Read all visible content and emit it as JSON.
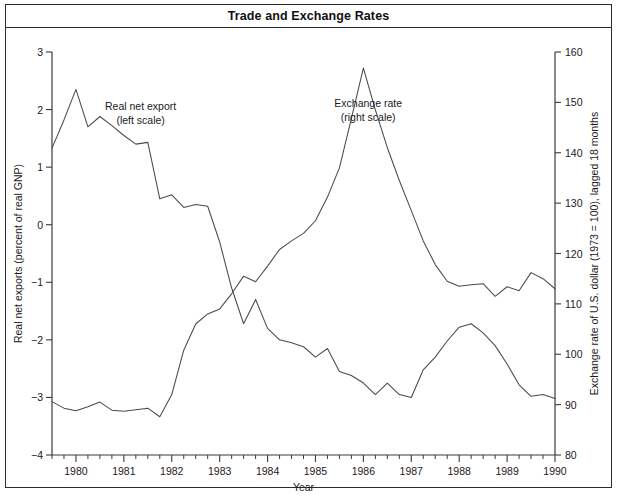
{
  "figure": {
    "title": "Trade and Exchange Rates"
  },
  "chart_data": {
    "type": "line",
    "title": "Trade and Exchange Rates",
    "xlabel": "Year",
    "ylabel": "Real net exports (percent of real GNP)",
    "y2label": "Exchange rate of U.S. dollar (1973 = 100), lagged 18 months",
    "xlim": [
      1979.5,
      1990.0
    ],
    "ylim": [
      -4,
      3
    ],
    "y2lim": [
      80,
      160
    ],
    "grid": false,
    "legend_position": "inline-annotations",
    "x_major_ticks": [
      1980,
      1981,
      1982,
      1983,
      1984,
      1985,
      1986,
      1987,
      1988,
      1989,
      1990
    ],
    "x_tick_labels": [
      "1980",
      "1981",
      "1982",
      "1983",
      "1984",
      "1985",
      "1986",
      "1987",
      "1988",
      "1989",
      "1990"
    ],
    "x_minor_interval_quarters": 1,
    "y_ticks": [
      3,
      2,
      1,
      0,
      -1,
      -2,
      -3,
      -4
    ],
    "y_tick_labels": [
      "3",
      "2",
      "1",
      "0",
      "−1",
      "−2",
      "−3",
      "−4"
    ],
    "y2_ticks": [
      160,
      150,
      140,
      130,
      120,
      110,
      100,
      90,
      80
    ],
    "y2_tick_labels": [
      "160",
      "150",
      "140",
      "130",
      "120",
      "110",
      "100",
      "90",
      "80"
    ],
    "annotations": [
      {
        "name": "real-net-export",
        "line1": "Real net export",
        "line2": "(left scale)",
        "x": 1981.35,
        "y": 2.0
      },
      {
        "name": "exchange-rate",
        "line1": "Exchange rate",
        "line2": "(right scale)",
        "x": 1986.1,
        "y": 2.05
      }
    ],
    "series": [
      {
        "name": "Real net export",
        "axis": "left",
        "units": "percent of real GNP",
        "x": [
          1979.5,
          1979.75,
          1980.0,
          1980.25,
          1980.5,
          1980.75,
          1981.0,
          1981.25,
          1981.5,
          1981.75,
          1982.0,
          1982.25,
          1982.5,
          1982.75,
          1983.0,
          1983.25,
          1983.5,
          1983.75,
          1984.0,
          1984.25,
          1984.5,
          1984.75,
          1985.0,
          1985.25,
          1985.5,
          1985.75,
          1986.0,
          1986.25,
          1986.5,
          1986.75,
          1987.0,
          1987.25,
          1987.5,
          1987.75,
          1988.0,
          1988.25,
          1988.5,
          1988.75,
          1989.0,
          1989.25,
          1989.5,
          1989.75,
          1990.0
        ],
        "values": [
          1.33,
          1.82,
          2.35,
          1.7,
          1.88,
          1.72,
          1.55,
          1.4,
          1.43,
          0.45,
          0.52,
          0.3,
          0.35,
          0.32,
          -0.3,
          -1.1,
          -1.72,
          -1.3,
          -1.8,
          -2.0,
          -2.05,
          -2.12,
          -2.3,
          -2.15,
          -2.55,
          -2.62,
          -2.75,
          -2.95,
          -2.75,
          -2.95,
          -3.0,
          -2.52,
          -2.3,
          -2.02,
          -1.78,
          -1.72,
          -1.88,
          -2.1,
          -2.42,
          -2.78,
          -2.98,
          -2.95,
          -3.02
        ]
      },
      {
        "name": "Exchange rate",
        "axis": "right",
        "units": "index 1973 = 100, lagged 18 months",
        "x": [
          1979.5,
          1979.75,
          1980.0,
          1980.25,
          1980.5,
          1980.75,
          1981.0,
          1981.25,
          1981.5,
          1981.75,
          1982.0,
          1982.25,
          1982.5,
          1982.75,
          1983.0,
          1983.25,
          1983.5,
          1983.75,
          1984.0,
          1984.25,
          1984.5,
          1984.75,
          1985.0,
          1985.25,
          1985.5,
          1985.75,
          1986.0,
          1986.25,
          1986.5,
          1986.75,
          1987.0,
          1987.25,
          1987.5,
          1987.75,
          1988.0,
          1988.25,
          1988.5,
          1988.75,
          1989.0,
          1989.25,
          1989.5,
          1989.75,
          1990.0
        ],
        "values": [
          90.6,
          89.3,
          88.8,
          89.6,
          90.5,
          88.9,
          88.7,
          89.0,
          89.3,
          87.6,
          92.0,
          100.8,
          106.0,
          108.0,
          109.0,
          112.0,
          115.5,
          114.4,
          117.5,
          120.8,
          122.5,
          124.0,
          126.5,
          131.2,
          137.0,
          146.8,
          156.8,
          148.5,
          141.0,
          134.5,
          128.5,
          122.5,
          117.8,
          114.5,
          113.5,
          113.8,
          114.0,
          111.5,
          113.4,
          112.6,
          116.2,
          115.0,
          113.0
        ]
      }
    ]
  }
}
